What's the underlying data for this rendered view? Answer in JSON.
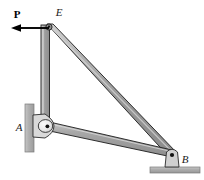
{
  "figure": {
    "type": "statics-truss-free-body-diagram",
    "background_color": "#ffffff",
    "width": 204,
    "height": 180
  },
  "colors": {
    "member_fill": "#9a9a9a",
    "member_fill_light": "#c9c9c9",
    "member_fill_dark": "#7d7d7d",
    "member_outline": "#1c1c1c",
    "support_fill": "#b3b3b3",
    "support_outline": "#6e6e6e",
    "pin_hub_fill": "#efefef",
    "pin_dot": "#111111",
    "arrow_color": "#000000",
    "label_color": "#1a1a1a"
  },
  "labels": {
    "load": {
      "name": "P",
      "style": "bold",
      "x": 17,
      "y": 18
    },
    "joint_e": {
      "name": "E",
      "style": "italic",
      "x": 59,
      "y": 16
    },
    "joint_a": {
      "name": "A",
      "style": "italic",
      "x": 19,
      "y": 131
    },
    "joint_b": {
      "name": "B",
      "style": "italic",
      "x": 182,
      "y": 163
    }
  },
  "joints": [
    {
      "id": "E",
      "label": "E",
      "x": 49,
      "y": 27,
      "type": "pin-top"
    },
    {
      "id": "A",
      "label": "A",
      "x": 45,
      "y": 126,
      "type": "pin-wall"
    },
    {
      "id": "B",
      "label": "B",
      "x": 172,
      "y": 157,
      "type": "pin-ground"
    }
  ],
  "members": [
    {
      "id": "EA",
      "from": "E",
      "to": "A",
      "orientation": "vertical",
      "thickness": 8
    },
    {
      "id": "EB",
      "from": "E",
      "to": "B",
      "orientation": "diagonal",
      "thickness": 9
    },
    {
      "id": "AB",
      "from": "A",
      "to": "B",
      "orientation": "near-horizontal",
      "thickness": 7
    }
  ],
  "supports": [
    {
      "id": "wall-A",
      "kind": "vertical-wall",
      "x": 25,
      "y": 104,
      "width": 9,
      "height": 48
    },
    {
      "id": "ground-B",
      "kind": "horizontal-ground",
      "x": 150,
      "y": 168,
      "width": 50,
      "height": 6
    }
  ],
  "load_arrow": {
    "label": "P",
    "direction": "left",
    "tail_x": 49,
    "tail_y": 28,
    "head_x": 13,
    "head_y": 28,
    "line_width": 2
  }
}
